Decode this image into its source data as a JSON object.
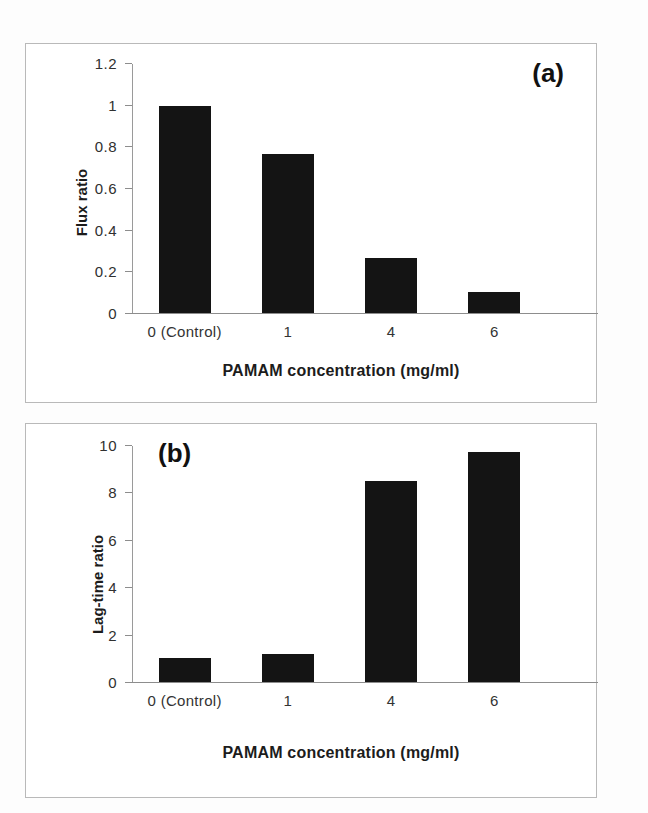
{
  "figure": {
    "background": "#fdfdfd",
    "bar_color": "#141414",
    "axis_color": "#8d8d8d"
  },
  "panels": [
    {
      "tag": "(a)",
      "xlabel": "PAMAM concentration (mg/ml)",
      "ylabel": "Flux ratio",
      "yticks": [
        "0",
        "0.2",
        "0.4",
        "0.6",
        "0.8",
        "1",
        "1.2"
      ],
      "categories": [
        "0 (Control)",
        "1",
        "4",
        "6"
      ]
    },
    {
      "tag": "(b)",
      "xlabel": "PAMAM concentration (mg/ml)",
      "ylabel": "Lag-time ratio",
      "yticks": [
        "0",
        "2",
        "4",
        "6",
        "8",
        "10"
      ],
      "categories": [
        "0 (Control)",
        "1",
        "4",
        "6"
      ]
    }
  ],
  "chart_data": [
    {
      "type": "bar",
      "panel": "(a)",
      "title": "",
      "categories": [
        "0 (Control)",
        "1",
        "4",
        "6"
      ],
      "values": [
        1.0,
        0.765,
        0.265,
        0.1
      ],
      "xlabel": "PAMAM concentration (mg/ml)",
      "ylabel": "Flux ratio",
      "ylim": [
        0,
        1.2
      ],
      "yticks": [
        0,
        0.2,
        0.4,
        0.6,
        0.8,
        1,
        1.2
      ],
      "ytick_labels": [
        "0",
        "0.2",
        "0.4",
        "0.6",
        "0.8",
        "1",
        "1.2"
      ],
      "grid": false,
      "legend": false,
      "bar_color": "#141414"
    },
    {
      "type": "bar",
      "panel": "(b)",
      "title": "",
      "categories": [
        "0 (Control)",
        "1",
        "4",
        "6"
      ],
      "values": [
        1.0,
        1.2,
        8.5,
        9.75
      ],
      "xlabel": "PAMAM concentration (mg/ml)",
      "ylabel": "Lag-time ratio",
      "ylim": [
        0,
        10
      ],
      "yticks": [
        0,
        2,
        4,
        6,
        8,
        10
      ],
      "ytick_labels": [
        "0",
        "2",
        "4",
        "6",
        "8",
        "10"
      ],
      "grid": false,
      "legend": false,
      "bar_color": "#141414"
    }
  ]
}
